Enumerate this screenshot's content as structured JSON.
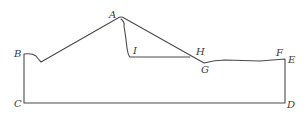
{
  "diagram": {
    "type": "cross-section outline",
    "stroke_color": "#4a4a4a",
    "label_color": "#3a3a3a",
    "points": {
      "A": {
        "label": "A",
        "x": 120,
        "y": 18,
        "label_x": 109,
        "label_y": 18
      },
      "B": {
        "label": "B",
        "x": 24,
        "y": 54,
        "label_x": 14,
        "label_y": 57
      },
      "C": {
        "label": "C",
        "x": 24,
        "y": 103,
        "label_x": 14,
        "label_y": 107
      },
      "D": {
        "label": "D",
        "x": 285,
        "y": 103,
        "label_x": 287,
        "label_y": 108
      },
      "E": {
        "label": "E",
        "x": 285,
        "y": 59,
        "label_x": 288,
        "label_y": 63
      },
      "F": {
        "label": "F",
        "x": 284,
        "y": 59,
        "label_x": 276,
        "label_y": 56
      },
      "G": {
        "label": "G",
        "x": 204,
        "y": 63,
        "label_x": 201,
        "label_y": 73
      },
      "H": {
        "label": "H",
        "x": 190,
        "y": 57,
        "label_x": 196,
        "label_y": 55
      },
      "I": {
        "label": "I",
        "x": 130,
        "y": 57,
        "label_x": 133,
        "label_y": 54
      }
    },
    "paths": {
      "outer": "M24,103 L24,54 Q32,53 36,56 Q39,60 41,62 L118,18 Q121,16 124,18 L204,63 Q215,60 225,60 L260,61 Q272,60 285,59 L285,103 Z",
      "inner_face": "M121,19 Q125,22 124,26 Q126,38 127,48 Q128,55 130,57 L190,57"
    }
  }
}
